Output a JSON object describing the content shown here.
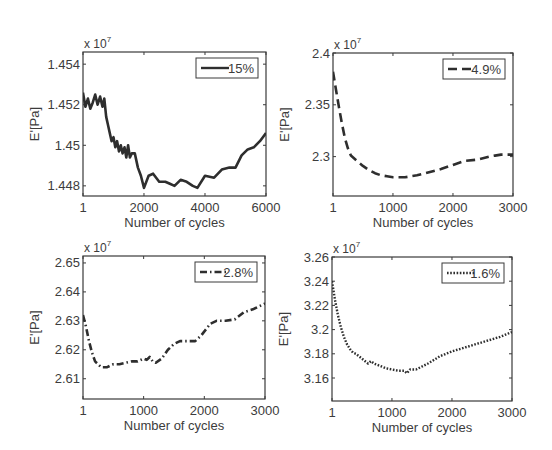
{
  "figure": {
    "width": 552,
    "height": 450,
    "line_color": "#2e2e2e",
    "frame_color": "#3a3a3a",
    "background": "#ffffff"
  },
  "chart_data": [
    {
      "type": "line",
      "panel": "top-left",
      "title": "",
      "xlabel": "Number of cycles",
      "ylabel": "E'[Pa]",
      "y_multiplier": "x 10",
      "y_exponent": "7",
      "xlim": [
        1,
        6000
      ],
      "ylim": [
        1.4475,
        1.4546
      ],
      "xticks": [
        1,
        2000,
        4000,
        6000
      ],
      "xtick_labels": [
        "1",
        "2000",
        "4000",
        "6000"
      ],
      "yticks": [
        1.448,
        1.45,
        1.452,
        1.454
      ],
      "ytick_labels": [
        "1.448",
        "1.45",
        "1.452",
        "1.454"
      ],
      "grid": false,
      "legend_position": "upper right",
      "frame": {
        "x": 83,
        "y": 52,
        "w": 183,
        "h": 144
      },
      "series": [
        {
          "name": "15%",
          "style": "solid",
          "x": [
            1,
            80,
            160,
            240,
            320,
            400,
            480,
            560,
            640,
            700,
            760,
            820,
            880,
            940,
            1000,
            1060,
            1120,
            1180,
            1240,
            1300,
            1360,
            1420,
            1480,
            1540,
            1600,
            1700,
            1800,
            1900,
            2000,
            2150,
            2300,
            2500,
            2700,
            2850,
            3000,
            3200,
            3400,
            3600,
            3750,
            4000,
            4300,
            4550,
            4800,
            5000,
            5200,
            5400,
            5600,
            5800,
            6000
          ],
          "y": [
            1.4526,
            1.4519,
            1.4523,
            1.4518,
            1.4521,
            1.4525,
            1.452,
            1.4524,
            1.4519,
            1.4523,
            1.4514,
            1.451,
            1.4506,
            1.4502,
            1.4504,
            1.4499,
            1.4502,
            1.4497,
            1.45,
            1.4496,
            1.4499,
            1.4494,
            1.45,
            1.4494,
            1.4496,
            1.4496,
            1.4489,
            1.4485,
            1.4479,
            1.4485,
            1.4486,
            1.4482,
            1.4482,
            1.4481,
            1.448,
            1.4483,
            1.4482,
            1.448,
            1.4479,
            1.4485,
            1.4484,
            1.4488,
            1.4489,
            1.4489,
            1.4495,
            1.4498,
            1.4499,
            1.4502,
            1.4506
          ]
        }
      ]
    },
    {
      "type": "line",
      "panel": "top-right",
      "title": "",
      "xlabel": "Number of cycles",
      "ylabel": "E'[Pa]",
      "y_multiplier": "x 10",
      "y_exponent": "7",
      "xlim": [
        1,
        3000
      ],
      "ylim": [
        2.262,
        2.4
      ],
      "xticks": [
        1,
        1000,
        2000,
        3000
      ],
      "xtick_labels": [
        "1",
        "1000",
        "2000",
        "3000"
      ],
      "yticks": [
        2.3,
        2.35,
        2.4
      ],
      "ytick_labels": [
        "2.3",
        "2.35",
        "2.4"
      ],
      "grid": false,
      "legend_position": "upper right",
      "frame": {
        "x": 333,
        "y": 53,
        "w": 180,
        "h": 143
      },
      "series": [
        {
          "name": "4.9%",
          "style": "dashed",
          "x": [
            1,
            50,
            100,
            150,
            200,
            250,
            300,
            400,
            500,
            600,
            700,
            800,
            900,
            1000,
            1100,
            1200,
            1300,
            1400,
            1600,
            1800,
            2000,
            2200,
            2400,
            2600,
            2700,
            2800,
            3000
          ],
          "y": [
            2.382,
            2.365,
            2.348,
            2.332,
            2.318,
            2.308,
            2.301,
            2.296,
            2.291,
            2.287,
            2.284,
            2.282,
            2.281,
            2.28,
            2.28,
            2.28,
            2.281,
            2.282,
            2.285,
            2.288,
            2.292,
            2.296,
            2.297,
            2.3,
            2.301,
            2.302,
            2.302
          ]
        }
      ]
    },
    {
      "type": "line",
      "panel": "bottom-left",
      "title": "",
      "xlabel": "Number of cycles",
      "ylabel": "E'[Pa]",
      "y_multiplier": "x 10",
      "y_exponent": "7",
      "xlim": [
        1,
        3000
      ],
      "ylim": [
        2.603,
        2.6524
      ],
      "xticks": [
        1,
        1000,
        2000,
        3000
      ],
      "xtick_labels": [
        "1",
        "1000",
        "2000",
        "3000"
      ],
      "yticks": [
        2.61,
        2.62,
        2.63,
        2.64,
        2.65
      ],
      "ytick_labels": [
        "2.61",
        "2.62",
        "2.63",
        "2.64",
        "2.65"
      ],
      "grid": false,
      "legend_position": "upper right",
      "frame": {
        "x": 83,
        "y": 256,
        "w": 182,
        "h": 143
      },
      "series": [
        {
          "name": "2.8%",
          "style": "dash-dot",
          "x": [
            1,
            50,
            100,
            150,
            200,
            250,
            300,
            350,
            400,
            450,
            500,
            600,
            700,
            800,
            900,
            1000,
            1050,
            1100,
            1150,
            1200,
            1300,
            1400,
            1500,
            1600,
            1700,
            1850,
            1950,
            2100,
            2200,
            2350,
            2500,
            2650,
            2800,
            3000
          ],
          "y": [
            2.632,
            2.628,
            2.623,
            2.619,
            2.616,
            2.615,
            2.614,
            2.614,
            2.614,
            2.6145,
            2.615,
            2.615,
            2.6155,
            2.616,
            2.616,
            2.617,
            2.6165,
            2.6175,
            2.616,
            2.6155,
            2.617,
            2.62,
            2.622,
            2.623,
            2.623,
            2.623,
            2.625,
            2.629,
            2.63,
            2.63,
            2.6305,
            2.633,
            2.634,
            2.636
          ]
        }
      ]
    },
    {
      "type": "line",
      "panel": "bottom-right",
      "title": "",
      "xlabel": "Number of cycles",
      "ylabel": "E'[Pa]",
      "y_multiplier": "x 10",
      "y_exponent": "7",
      "xlim": [
        1,
        3000
      ],
      "ylim": [
        3.141,
        3.26
      ],
      "xticks": [
        1,
        1000,
        2000,
        3000
      ],
      "xtick_labels": [
        "1",
        "1000",
        "2000",
        "3000"
      ],
      "yticks": [
        3.16,
        3.18,
        3.2,
        3.22,
        3.24,
        3.26
      ],
      "ytick_labels": [
        "3.16",
        "3.18",
        "3.2",
        "3.22",
        "3.24",
        "3.26"
      ],
      "grid": false,
      "legend_position": "upper right",
      "frame": {
        "x": 332,
        "y": 257,
        "w": 180,
        "h": 144
      },
      "series": [
        {
          "name": "1.6%",
          "style": "dotted",
          "x": [
            1,
            50,
            100,
            150,
            200,
            250,
            300,
            350,
            400,
            500,
            600,
            650,
            700,
            800,
            900,
            1000,
            1100,
            1200,
            1250,
            1300,
            1400,
            1600,
            1800,
            2000,
            2200,
            2400,
            2600,
            2800,
            3000
          ],
          "y": [
            3.24,
            3.225,
            3.212,
            3.202,
            3.194,
            3.188,
            3.184,
            3.181,
            3.18,
            3.176,
            3.172,
            3.174,
            3.172,
            3.17,
            3.168,
            3.167,
            3.166,
            3.166,
            3.164,
            3.167,
            3.167,
            3.172,
            3.178,
            3.182,
            3.185,
            3.188,
            3.191,
            3.194,
            3.198
          ]
        }
      ]
    }
  ]
}
